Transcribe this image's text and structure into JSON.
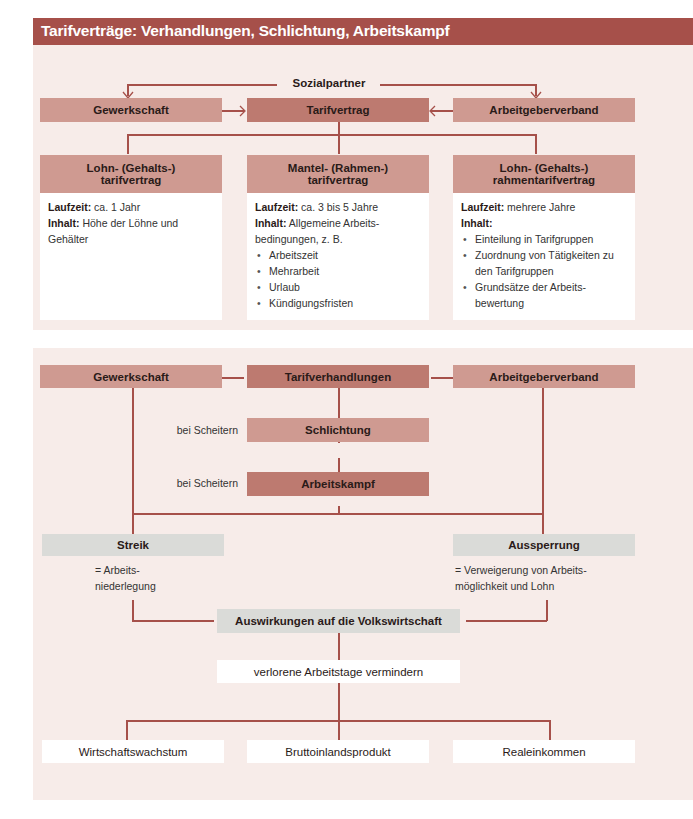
{
  "title": "Tarifverträge: Verhandlungen, Schlichtung, Arbeitskampf",
  "colors": {
    "title_bar": "#a6504a",
    "section_bg": "#f7ece9",
    "box_light": "#cf9a91",
    "box_dark": "#bd7a70",
    "box_gray": "#dadbd8",
    "line": "#a6504a"
  },
  "section1": {
    "top_label": "Sozialpartner",
    "left": "Gewerkschaft",
    "center": "Tarifvertrag",
    "right": "Arbeitgeberverband",
    "contracts": [
      {
        "title_l1": "Lohn- (Gehalts-)",
        "title_l2": "tarifvertrag",
        "laufzeit_label": "Laufzeit:",
        "laufzeit": " ca. 1 Jahr",
        "inhalt_label": "Inhalt:",
        "inhalt": " Höhe der Löhne und Gehälter",
        "bullets": []
      },
      {
        "title_l1": "Mantel- (Rahmen-)",
        "title_l2": "tarifvertrag",
        "laufzeit_label": "Laufzeit:",
        "laufzeit": " ca. 3 bis 5 Jahre",
        "inhalt_label": "Inhalt:",
        "inhalt": " Allgemeine Arbeits­bedingungen, z. B.",
        "bullets": [
          "Arbeitszeit",
          "Mehrarbeit",
          "Urlaub",
          "Kündigungsfristen"
        ]
      },
      {
        "title_l1": "Lohn- (Gehalts-)",
        "title_l2": "rahmentarifvertrag",
        "laufzeit_label": "Laufzeit:",
        "laufzeit": " mehrere Jahre",
        "inhalt_label": "Inhalt:",
        "inhalt": "",
        "bullets": [
          "Einteilung in Tarifgruppen",
          "Zuordnung von Tätigkeiten zu den Tarifgruppen",
          "Grundsätze der Arbeits­bewertung"
        ]
      }
    ]
  },
  "section2": {
    "left": "Gewerkschaft",
    "center": "Tarifverhandlungen",
    "right": "Arbeitgeberverband",
    "fail_label_1": "bei Scheitern",
    "step1": "Schlichtung",
    "fail_label_2": "bei Scheitern",
    "step2": "Arbeitskampf",
    "strike": "Streik",
    "strike_desc": "= Arbeits­niederlegung",
    "lockout": "Aussperrung",
    "lockout_desc": "= Verweigerung von Arbeits­möglichkeit und Lohn",
    "effects": "Auswirkungen auf die Volkswirtschaft",
    "reduce": "verlorene Arbeitstage vermindern",
    "outcomes": [
      "Wirtschaftswachstum",
      "Bruttoinlandsprodukt",
      "Realeinkommen"
    ]
  }
}
